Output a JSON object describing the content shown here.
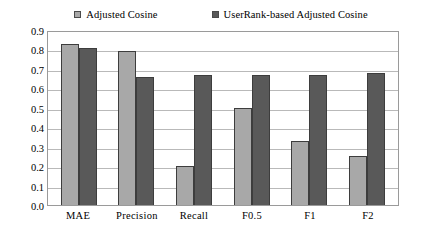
{
  "chart_data": {
    "type": "bar",
    "title": "",
    "subtitle": "",
    "xlabel": "",
    "ylabel": "",
    "ylim": [
      0.0,
      0.9
    ],
    "ytick_step": 0.1,
    "grid": true,
    "legend_position": "top-center",
    "categories": [
      "MAE",
      "Precision",
      "Recall",
      "F0.5",
      "F1",
      "F2"
    ],
    "ytick_labels": [
      "0.9",
      "0.8",
      "0.7",
      "0.6",
      "0.5",
      "0.4",
      "0.3",
      "0.2",
      "0.1",
      "0.0"
    ],
    "ytick_values": [
      0.9,
      0.8,
      0.7,
      0.6,
      0.5,
      0.4,
      0.3,
      0.2,
      0.1,
      0.0
    ],
    "series": [
      {
        "name": "Adjusted Cosine",
        "color": "#a8a8a8",
        "values": [
          0.83,
          0.79,
          0.2,
          0.5,
          0.33,
          0.25
        ]
      },
      {
        "name": "UserRank-based Adjusted Cosine",
        "color": "#595959",
        "values": [
          0.81,
          0.66,
          0.67,
          0.67,
          0.67,
          0.68
        ]
      }
    ]
  },
  "legend": {
    "items": [
      {
        "label": "Adjusted Cosine",
        "color": "#a8a8a8"
      },
      {
        "label": "UserRank-based Adjusted Cosine",
        "color": "#595959"
      }
    ]
  },
  "colors": {
    "series_light": "#a8a8a8",
    "series_dark": "#595959",
    "gridline": "#b9b9b9",
    "frame": "#9a9a9a",
    "background": "#ffffff",
    "text": "#000000"
  }
}
